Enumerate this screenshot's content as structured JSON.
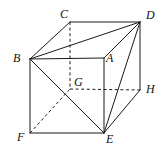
{
  "figure": {
    "stroke_color": "#1a1a1a",
    "background_color": "#ffffff",
    "width": 165,
    "height": 152,
    "vertices": [
      {
        "name": "C",
        "label": "C",
        "x": 70,
        "y": 22,
        "label_x": 60,
        "label_y": 8,
        "hidden": false
      },
      {
        "name": "D",
        "label": "D",
        "x": 140,
        "y": 22,
        "label_x": 146,
        "label_y": 9,
        "hidden": false
      },
      {
        "name": "B",
        "label": "B",
        "x": 30,
        "y": 59,
        "label_x": 13,
        "label_y": 52,
        "hidden": false
      },
      {
        "name": "A",
        "label": "A",
        "x": 104,
        "y": 58,
        "label_x": 106,
        "label_y": 52,
        "hidden": false
      },
      {
        "name": "G",
        "label": "G",
        "x": 70,
        "y": 89,
        "label_x": 74,
        "label_y": 76,
        "hidden": true
      },
      {
        "name": "H",
        "label": "H",
        "x": 140,
        "y": 90,
        "label_x": 146,
        "label_y": 83,
        "hidden": false
      },
      {
        "name": "F",
        "label": "F",
        "x": 30,
        "y": 133,
        "label_x": 17,
        "label_y": 131,
        "hidden": false
      },
      {
        "name": "E",
        "label": "E",
        "x": 104,
        "y": 133,
        "label_x": 106,
        "label_y": 133,
        "hidden": false
      }
    ],
    "edges_solid": [
      {
        "name": "edge-B-C",
        "from": "B",
        "to": "C"
      },
      {
        "name": "edge-C-D",
        "from": "C",
        "to": "D"
      },
      {
        "name": "edge-B-D",
        "from": "B",
        "to": "D"
      },
      {
        "name": "edge-B-A",
        "from": "B",
        "to": "A"
      },
      {
        "name": "edge-A-D",
        "from": "A",
        "to": "D"
      },
      {
        "name": "edge-B-F",
        "from": "B",
        "to": "F"
      },
      {
        "name": "edge-A-E",
        "from": "A",
        "to": "E"
      },
      {
        "name": "edge-D-H",
        "from": "D",
        "to": "H"
      },
      {
        "name": "edge-F-E",
        "from": "F",
        "to": "E"
      },
      {
        "name": "edge-E-H",
        "from": "E",
        "to": "H"
      },
      {
        "name": "edge-B-E",
        "from": "B",
        "to": "E"
      },
      {
        "name": "edge-D-E",
        "from": "D",
        "to": "E"
      }
    ],
    "edges_dashed": [
      {
        "name": "edge-C-G",
        "from": "C",
        "to": "G"
      },
      {
        "name": "edge-G-H",
        "from": "G",
        "to": "H"
      },
      {
        "name": "edge-F-G",
        "from": "F",
        "to": "G"
      }
    ]
  }
}
